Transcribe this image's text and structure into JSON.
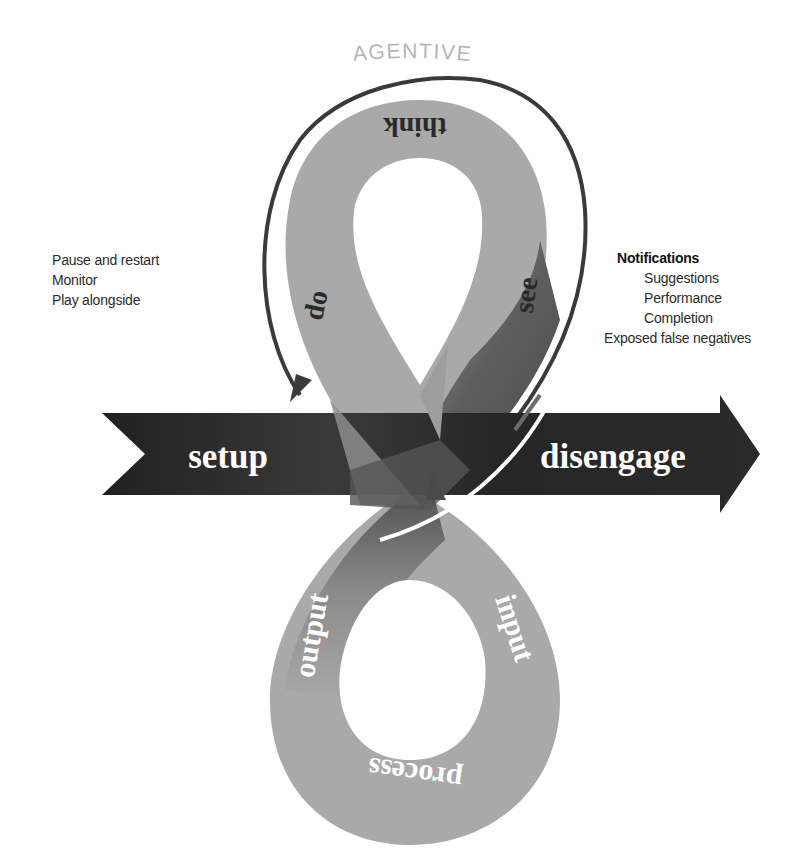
{
  "title": "AGENTIVE",
  "colors": {
    "loop_light": "#a9a9a9",
    "loop_dark": "#6a6a6a",
    "band_dark": "#1e1e1e",
    "title_gray": "#b5b5b5",
    "outline_arrow": "#3a3a3a"
  },
  "band": {
    "left_label": "setup",
    "right_label": "disengage"
  },
  "upper_loop": {
    "top_label": "think",
    "left_label": "do",
    "right_label": "see"
  },
  "lower_loop": {
    "left_label": "output",
    "right_label": "input",
    "bottom_label": "process"
  },
  "left_notes": {
    "items": [
      "Pause and restart",
      "Monitor",
      "Play alongside"
    ]
  },
  "right_notes": {
    "heading": "Notifications",
    "sub_items": [
      "Suggestions",
      "Performance",
      "Completion"
    ],
    "extra": "Exposed false negatives"
  }
}
